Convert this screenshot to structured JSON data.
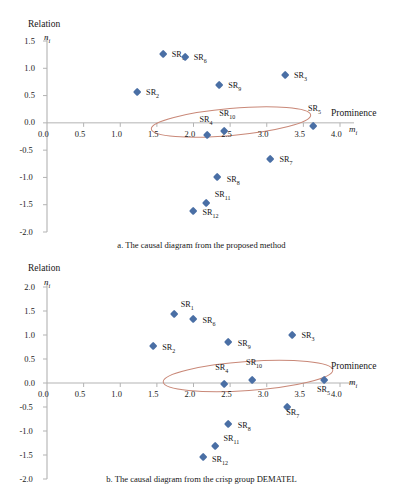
{
  "figure": {
    "axis_y_title": "Relation",
    "axis_x_title": "Prominence",
    "axis_y_var": "n",
    "axis_y_var_sub": "i",
    "axis_x_var": "m",
    "axis_x_var_sub": "i",
    "marker_color": "#4a6fa5",
    "ellipse_color": "#c98878",
    "axis_color": "#b3b3b3"
  },
  "chart_data": [
    {
      "type": "scatter",
      "id": "a",
      "title": "a. The causal diagram from the proposed method",
      "xlabel": "Prominence",
      "ylabel": "Relation",
      "xlim": [
        0.0,
        4.0
      ],
      "ylim": [
        -2.0,
        1.5
      ],
      "xticks": [
        "0.0",
        "0.5",
        "1.0",
        "1.5",
        "2.0",
        "2.5",
        "3.0",
        "3.5",
        "4.0"
      ],
      "xtick_values": [
        0.0,
        0.5,
        1.0,
        1.5,
        2.0,
        2.5,
        3.0,
        3.5,
        4.0
      ],
      "yticks": [
        "1.5",
        "1.0",
        "0.5",
        "0.0",
        "-0.5",
        "-1.0",
        "-1.5",
        "-2.0"
      ],
      "ytick_values": [
        1.5,
        1.0,
        0.5,
        0.0,
        -0.5,
        -1.0,
        -1.5,
        -2.0
      ],
      "grid": false,
      "legend": "none",
      "annotation": "ellipse highlighting SR4, SR10, SR5 near Relation = 0",
      "points": [
        {
          "name": "SR",
          "sub": "1",
          "x": 1.58,
          "y": 1.26,
          "lx": 9,
          "ly": 1
        },
        {
          "name": "SR",
          "sub": "6",
          "x": 1.88,
          "y": 1.21,
          "lx": 9,
          "ly": 1
        },
        {
          "name": "SR",
          "sub": "3",
          "x": 3.25,
          "y": 0.88,
          "lx": 9,
          "ly": 1
        },
        {
          "name": "SR",
          "sub": "9",
          "x": 2.35,
          "y": 0.69,
          "lx": 9,
          "ly": 1
        },
        {
          "name": "SR",
          "sub": "2",
          "x": 1.23,
          "y": 0.56,
          "lx": 9,
          "ly": 1
        },
        {
          "name": "SR",
          "sub": "4",
          "x": 2.19,
          "y": -0.22,
          "lx": -8,
          "ly": -15
        },
        {
          "name": "SR",
          "sub": "10",
          "x": 2.42,
          "y": -0.15,
          "lx": -5,
          "ly": -17
        },
        {
          "name": "SR",
          "sub": "5",
          "x": 3.63,
          "y": -0.06,
          "lx": -5,
          "ly": -17
        },
        {
          "name": "SR",
          "sub": "7",
          "x": 3.05,
          "y": -0.66,
          "lx": 9,
          "ly": 1
        },
        {
          "name": "SR",
          "sub": "8",
          "x": 2.33,
          "y": -1.0,
          "lx": 9,
          "ly": 3
        },
        {
          "name": "SR",
          "sub": "11",
          "x": 2.18,
          "y": -1.47,
          "lx": 8,
          "ly": -8
        },
        {
          "name": "SR",
          "sub": "12",
          "x": 2.0,
          "y": -1.62,
          "lx": 9,
          "ly": 2
        }
      ]
    },
    {
      "type": "scatter",
      "id": "b",
      "title": "b. The causal diagram from the crisp group DEMATEL",
      "xlabel": "Prominence",
      "ylabel": "Relation",
      "xlim": [
        0.0,
        4.0
      ],
      "ylim": [
        -2.0,
        2.0
      ],
      "xticks": [
        "0.0",
        "0.5",
        "1.0",
        "1.5",
        "2.0",
        "2.5",
        "3.0",
        "3.5",
        "4.0"
      ],
      "xtick_values": [
        0.0,
        0.5,
        1.0,
        1.5,
        2.0,
        2.5,
        3.0,
        3.5,
        4.0
      ],
      "yticks": [
        "2.0",
        "1.5",
        "1.0",
        "0.5",
        "0.0",
        "-0.5",
        "-1.0",
        "-1.5",
        "-2.0"
      ],
      "ytick_values": [
        2.0,
        1.5,
        1.0,
        0.5,
        0.0,
        -0.5,
        -1.0,
        -1.5,
        -2.0
      ],
      "grid": false,
      "legend": "none",
      "annotation": "ellipse highlighting SR4, SR10, SR5 near Relation = 0",
      "points": [
        {
          "name": "SR",
          "sub": "1",
          "x": 1.73,
          "y": 1.44,
          "lx": 7,
          "ly": -9
        },
        {
          "name": "SR",
          "sub": "6",
          "x": 2.0,
          "y": 1.33,
          "lx": 9,
          "ly": 2
        },
        {
          "name": "SR",
          "sub": "3",
          "x": 3.35,
          "y": 1.0,
          "lx": 9,
          "ly": 1
        },
        {
          "name": "SR",
          "sub": "9",
          "x": 2.48,
          "y": 0.86,
          "lx": 9,
          "ly": 2
        },
        {
          "name": "SR",
          "sub": "2",
          "x": 1.45,
          "y": 0.77,
          "lx": 9,
          "ly": 2
        },
        {
          "name": "SR",
          "sub": "4",
          "x": 2.42,
          "y": -0.03,
          "lx": -9,
          "ly": -16
        },
        {
          "name": "SR",
          "sub": "10",
          "x": 2.8,
          "y": 0.05,
          "lx": -6,
          "ly": -18
        },
        {
          "name": "SR",
          "sub": "5",
          "x": 3.78,
          "y": 0.05,
          "lx": -7,
          "ly": 9
        },
        {
          "name": "SR",
          "sub": "7",
          "x": 3.28,
          "y": -0.51,
          "lx": -1,
          "ly": 6
        },
        {
          "name": "SR",
          "sub": "8",
          "x": 2.48,
          "y": -0.86,
          "lx": 9,
          "ly": 2
        },
        {
          "name": "SR",
          "sub": "11",
          "x": 2.3,
          "y": -1.32,
          "lx": 8,
          "ly": -7
        },
        {
          "name": "SR",
          "sub": "12",
          "x": 2.13,
          "y": -1.55,
          "lx": 9,
          "ly": 3
        }
      ]
    }
  ]
}
